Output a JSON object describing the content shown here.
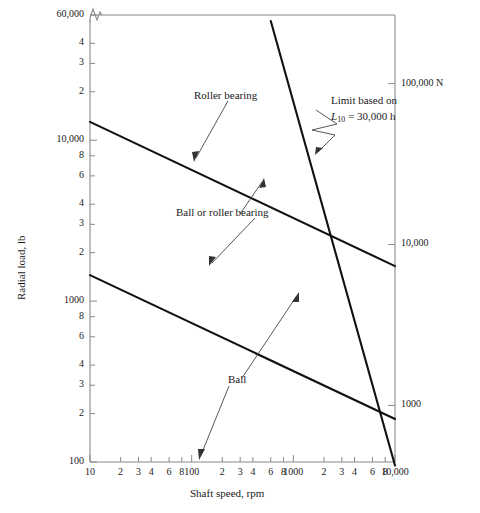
{
  "chart_data": {
    "type": "line",
    "title": "",
    "xlabel": "Shaft speed, rpm",
    "ylabel": "Radial load, lb",
    "y2label": "100,000 N",
    "xscale": "log",
    "yscale": "log",
    "xlim": [
      10,
      10000
    ],
    "ylim": [
      100,
      60000
    ],
    "grid": false,
    "legend_position": "inline-annotations",
    "x_ticks": [
      {
        "value": 10,
        "label": "10"
      },
      {
        "value": 20,
        "label": "2"
      },
      {
        "value": 30,
        "label": "3"
      },
      {
        "value": 40,
        "label": "4"
      },
      {
        "value": 60,
        "label": "6"
      },
      {
        "value": 80,
        "label": "8"
      },
      {
        "value": 100,
        "label": "100"
      },
      {
        "value": 200,
        "label": "2"
      },
      {
        "value": 300,
        "label": "3"
      },
      {
        "value": 400,
        "label": "4"
      },
      {
        "value": 600,
        "label": "6"
      },
      {
        "value": 800,
        "label": "8"
      },
      {
        "value": 1000,
        "label": "1000"
      },
      {
        "value": 2000,
        "label": "2"
      },
      {
        "value": 3000,
        "label": "3"
      },
      {
        "value": 4000,
        "label": "4"
      },
      {
        "value": 6000,
        "label": "6"
      },
      {
        "value": 8000,
        "label": "8"
      },
      {
        "value": 10000,
        "label": "10,000"
      }
    ],
    "y_ticks": [
      {
        "value": 60000,
        "label": "60,000"
      },
      {
        "value": 40000,
        "label": "4"
      },
      {
        "value": 30000,
        "label": "3"
      },
      {
        "value": 20000,
        "label": "2"
      },
      {
        "value": 10000,
        "label": "10,000"
      },
      {
        "value": 8000,
        "label": "8"
      },
      {
        "value": 6000,
        "label": "6"
      },
      {
        "value": 4000,
        "label": "4"
      },
      {
        "value": 3000,
        "label": "3"
      },
      {
        "value": 2000,
        "label": "2"
      },
      {
        "value": 1000,
        "label": "1000"
      },
      {
        "value": 800,
        "label": "8"
      },
      {
        "value": 600,
        "label": "6"
      },
      {
        "value": 400,
        "label": "4"
      },
      {
        "value": 300,
        "label": "3"
      },
      {
        "value": 200,
        "label": "2"
      },
      {
        "value": 100,
        "label": "100"
      },
      {
        "value": 80,
        "label": "8"
      },
      {
        "value": 60,
        "label": "6"
      },
      {
        "value": 40,
        "label": "4"
      },
      {
        "value": 30,
        "label": "3"
      },
      {
        "value": 20,
        "label": "2"
      }
    ],
    "y_right_ticks": [
      {
        "value": 100000,
        "label": "100,000 N"
      },
      {
        "value": 10000,
        "label": "10,000"
      },
      {
        "value": 1000,
        "label": "1000"
      },
      {
        "value": 100,
        "label": "100"
      }
    ],
    "series": [
      {
        "name": "Roller bearing",
        "points": [
          [
            10,
            13000
          ],
          [
            10000,
            1650
          ]
        ],
        "style": "solid-heavy"
      },
      {
        "name": "Ball or roller bearing",
        "points": [
          [
            10,
            1450
          ],
          [
            10000,
            185
          ]
        ],
        "style": "solid-heavy"
      },
      {
        "name": "Limit based on L10 = 30,000 h",
        "points": [
          [
            600,
            55000
          ],
          [
            10000,
            95
          ]
        ],
        "style": "solid-heavy"
      }
    ],
    "annotations": [
      {
        "id": "roller-bearing",
        "text": "Roller bearing",
        "target": [
          130,
          6400
        ]
      },
      {
        "id": "ball-or-roller",
        "text": "Ball or roller bearing",
        "target": [
          310,
          3400
        ]
      },
      {
        "id": "ball",
        "text": "Ball",
        "target": [
          130,
          105
        ]
      },
      {
        "id": "limit-line-1",
        "text": "Limit based on",
        "target": [
          2300,
          6400
        ]
      },
      {
        "id": "limit-line-2-prefix",
        "text": "L",
        "target": null
      },
      {
        "id": "limit-line-2-sub",
        "text": "10",
        "target": null
      },
      {
        "id": "limit-line-2-suffix",
        "text": " = 30,000 h",
        "target": null
      }
    ],
    "axis_break": {
      "axis": "y",
      "symbol": "zigzag",
      "position_note": "top of left axis above 60,000"
    }
  },
  "figure": {
    "ylabel": "Radial load, lb",
    "xlabel": "Shaft speed, rpm",
    "ink": "#1a1a1a",
    "axis_color": "#8a8a8a",
    "background": "#ffffff"
  },
  "annotations_text": {
    "roller_bearing": "Roller bearing",
    "ball_or_roller_bearing": "Ball or roller bearing",
    "ball": "Ball",
    "limit_line1": "Limit based on",
    "limit_L": "L",
    "limit_sub": "10",
    "limit_rest": "= 30,000 h"
  }
}
